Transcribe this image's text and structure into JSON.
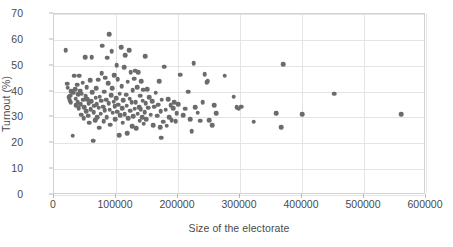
{
  "chart_data": {
    "type": "scatter",
    "title": "",
    "xlabel": "Size of the electorate",
    "ylabel": "Turnout (%)",
    "xlim": [
      0,
      600000
    ],
    "ylim": [
      0,
      70
    ],
    "xticks": [
      0,
      100000,
      200000,
      300000,
      400000,
      500000,
      600000
    ],
    "yticks": [
      0,
      10,
      20,
      30,
      40,
      50,
      60,
      70
    ],
    "xtick_labels": [
      "0",
      "100000",
      "200000",
      "300000",
      "400000",
      "500000",
      "600000"
    ],
    "ytick_labels": [
      "0",
      "10",
      "20",
      "30",
      "40",
      "50",
      "60",
      "70"
    ],
    "grid": true,
    "legend": false,
    "marker_color": "#6b6b6b",
    "marker_shape": "circle",
    "gridline_color": "#e4e4e4",
    "axis_color": "#d2d2d2",
    "text_color": "#4a4a4a",
    "series": [
      {
        "name": "constituencies",
        "points": [
          [
            19000,
            56.1
          ],
          [
            21000,
            43.0
          ],
          [
            22000,
            41.5
          ],
          [
            24000,
            37.8
          ],
          [
            25000,
            36.6
          ],
          [
            26000,
            38.4
          ],
          [
            27000,
            35.9
          ],
          [
            28000,
            40.2
          ],
          [
            30000,
            23.0
          ],
          [
            31000,
            39.5
          ],
          [
            33000,
            46.2
          ],
          [
            34000,
            41.0
          ],
          [
            35000,
            37.2
          ],
          [
            36000,
            34.8
          ],
          [
            37000,
            42.6
          ],
          [
            38000,
            36.0
          ],
          [
            39000,
            38.9
          ],
          [
            40000,
            33.5
          ],
          [
            41000,
            46.1
          ],
          [
            42000,
            40.4
          ],
          [
            43000,
            35.2
          ],
          [
            44000,
            31.0
          ],
          [
            45000,
            39.1
          ],
          [
            46000,
            43.5
          ],
          [
            47000,
            36.8
          ],
          [
            48000,
            29.8
          ],
          [
            49000,
            34.0
          ],
          [
            50000,
            53.3
          ],
          [
            51000,
            38.2
          ],
          [
            52000,
            32.4
          ],
          [
            53000,
            41.8
          ],
          [
            54000,
            37.0
          ],
          [
            55000,
            30.6
          ],
          [
            56000,
            35.4
          ],
          [
            57000,
            27.9
          ],
          [
            58000,
            44.3
          ],
          [
            59000,
            33.1
          ],
          [
            60000,
            36.2
          ],
          [
            61000,
            53.4
          ],
          [
            62000,
            39.7
          ],
          [
            63000,
            21.0
          ],
          [
            64000,
            32.0
          ],
          [
            65000,
            34.5
          ],
          [
            66000,
            29.0
          ],
          [
            67000,
            37.6
          ],
          [
            68000,
            41.2
          ],
          [
            69000,
            35.1
          ],
          [
            70000,
            30.2
          ],
          [
            71000,
            44.6
          ],
          [
            72000,
            33.8
          ],
          [
            73000,
            26.0
          ],
          [
            74000,
            38.0
          ],
          [
            75000,
            31.5
          ],
          [
            76000,
            36.4
          ],
          [
            77000,
            47.2
          ],
          [
            78000,
            57.8
          ],
          [
            79000,
            34.2
          ],
          [
            80000,
            28.5
          ],
          [
            81000,
            40.0
          ],
          [
            82000,
            32.8
          ],
          [
            83000,
            45.4
          ],
          [
            84000,
            36.9
          ],
          [
            85000,
            30.0
          ],
          [
            86000,
            53.1
          ],
          [
            87000,
            43.2
          ],
          [
            88000,
            35.6
          ],
          [
            89000,
            62.3
          ],
          [
            90000,
            33.0
          ],
          [
            91000,
            27.2
          ],
          [
            92000,
            38.6
          ],
          [
            93000,
            55.6
          ],
          [
            94000,
            41.4
          ],
          [
            95000,
            31.8
          ],
          [
            96000,
            36.1
          ],
          [
            97000,
            46.4
          ],
          [
            98000,
            34.4
          ],
          [
            99000,
            29.4
          ],
          [
            100000,
            37.4
          ],
          [
            101000,
            50.2
          ],
          [
            102000,
            32.2
          ],
          [
            103000,
            44.8
          ],
          [
            104000,
            35.0
          ],
          [
            105000,
            23.2
          ],
          [
            106000,
            39.2
          ],
          [
            107000,
            30.8
          ],
          [
            108000,
            57.1
          ],
          [
            109000,
            42.0
          ],
          [
            110000,
            33.6
          ],
          [
            111000,
            28.0
          ],
          [
            112000,
            36.6
          ],
          [
            113000,
            49.4
          ],
          [
            114000,
            31.2
          ],
          [
            115000,
            54.0
          ],
          [
            116000,
            38.8
          ],
          [
            117000,
            34.6
          ],
          [
            118000,
            24.0
          ],
          [
            119000,
            43.8
          ],
          [
            120000,
            29.6
          ],
          [
            121000,
            56.0
          ],
          [
            122000,
            37.2
          ],
          [
            123000,
            32.6
          ],
          [
            124000,
            47.6
          ],
          [
            125000,
            35.8
          ],
          [
            126000,
            26.5
          ],
          [
            127000,
            40.6
          ],
          [
            128000,
            30.4
          ],
          [
            129000,
            45.0
          ],
          [
            130000,
            33.4
          ],
          [
            131000,
            48.0
          ],
          [
            132000,
            36.0
          ],
          [
            133000,
            25.8
          ],
          [
            134000,
            41.6
          ],
          [
            135000,
            31.4
          ],
          [
            136000,
            47.4
          ],
          [
            137000,
            34.0
          ],
          [
            138000,
            28.8
          ],
          [
            139000,
            38.4
          ],
          [
            140000,
            33.2
          ],
          [
            141000,
            44.0
          ],
          [
            142000,
            30.0
          ],
          [
            143000,
            36.5
          ],
          [
            144000,
            40.8
          ],
          [
            145000,
            27.6
          ],
          [
            146000,
            32.0
          ],
          [
            147000,
            53.6
          ],
          [
            148000,
            35.4
          ],
          [
            149000,
            29.2
          ],
          [
            150000,
            41.0
          ],
          [
            152000,
            33.8
          ],
          [
            154000,
            37.8
          ],
          [
            156000,
            31.0
          ],
          [
            158000,
            36.2
          ],
          [
            160000,
            27.0
          ],
          [
            162000,
            34.2
          ],
          [
            164000,
            39.6
          ],
          [
            166000,
            30.6
          ],
          [
            168000,
            35.0
          ],
          [
            170000,
            44.0
          ],
          [
            171000,
            26.2
          ],
          [
            172000,
            32.4
          ],
          [
            173000,
            22.2
          ],
          [
            174000,
            36.8
          ],
          [
            176000,
            28.4
          ],
          [
            178000,
            49.6
          ],
          [
            180000,
            33.0
          ],
          [
            182000,
            26.8
          ],
          [
            184000,
            37.0
          ],
          [
            186000,
            30.2
          ],
          [
            188000,
            34.8
          ],
          [
            190000,
            29.0
          ],
          [
            192000,
            33.6
          ],
          [
            194000,
            36.0
          ],
          [
            196000,
            28.6
          ],
          [
            198000,
            31.6
          ],
          [
            200000,
            35.2
          ],
          [
            204000,
            46.5
          ],
          [
            208000,
            30.8
          ],
          [
            212000,
            33.4
          ],
          [
            216000,
            40.0
          ],
          [
            220000,
            29.4
          ],
          [
            222000,
            24.6
          ],
          [
            225000,
            51.0
          ],
          [
            228000,
            34.0
          ],
          [
            232000,
            31.8
          ],
          [
            236000,
            28.8
          ],
          [
            240000,
            36.0
          ],
          [
            243000,
            46.8
          ],
          [
            246000,
            43.6
          ],
          [
            248000,
            44.0
          ],
          [
            250000,
            29.0
          ],
          [
            255000,
            27.0
          ],
          [
            258000,
            34.8
          ],
          [
            262000,
            31.6
          ],
          [
            275000,
            46.2
          ],
          [
            290000,
            38.0
          ],
          [
            295000,
            34.0
          ],
          [
            298000,
            33.4
          ],
          [
            302000,
            34.2
          ],
          [
            322000,
            28.4
          ],
          [
            358000,
            31.6
          ],
          [
            366000,
            26.2
          ],
          [
            370000,
            50.6
          ],
          [
            400000,
            31.2
          ],
          [
            452000,
            39.2
          ],
          [
            560000,
            31.2
          ]
        ]
      }
    ]
  }
}
